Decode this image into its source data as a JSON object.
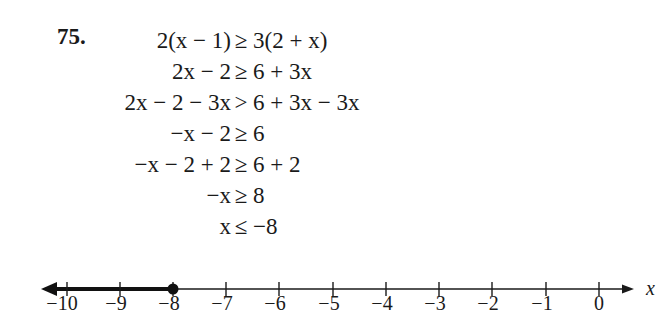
{
  "problem": {
    "number": "75.",
    "steps": [
      {
        "lhs": "2(x − 1)",
        "rel": "≥",
        "rhs": "3(2 + x)"
      },
      {
        "lhs": "2x − 2",
        "rel": "≥",
        "rhs": "6 + 3x"
      },
      {
        "lhs": "2x − 2 − 3x",
        "rel": ">",
        "rhs": "6 + 3x − 3x"
      },
      {
        "lhs": "−x − 2",
        "rel": "≥",
        "rhs": "6"
      },
      {
        "lhs": "−x − 2 + 2",
        "rel": "≥",
        "rhs": "6 + 2"
      },
      {
        "lhs": "−x",
        "rel": "≥",
        "rhs": "8"
      },
      {
        "lhs": "x",
        "rel": "≤",
        "rhs": "−8"
      }
    ]
  },
  "number_line": {
    "variable": "x",
    "ticks": [
      "−10",
      "−9",
      "−8",
      "−7",
      "−6",
      "−5",
      "−4",
      "−3",
      "−2",
      "−1",
      "0"
    ],
    "solution": {
      "endpoint": "−8",
      "endpoint_type": "closed",
      "direction": "left"
    },
    "colors": {
      "line": "#1a1a1a",
      "shaded": "#111111"
    }
  }
}
